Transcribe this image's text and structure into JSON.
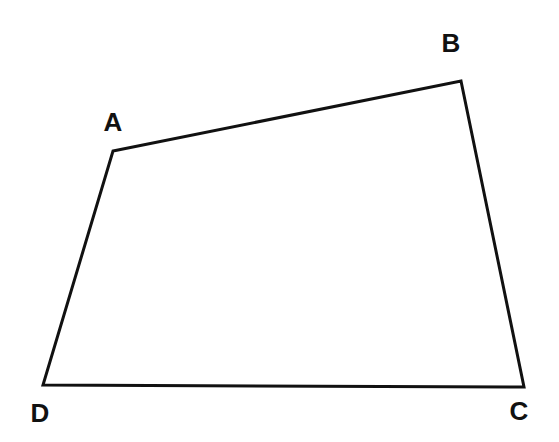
{
  "diagram": {
    "type": "quadrilateral",
    "stroke_color": "#111111",
    "stroke_width": 3,
    "vertices": [
      {
        "id": "A",
        "x": 113,
        "y": 151,
        "label": "A",
        "label_x": 113,
        "label_y": 131
      },
      {
        "id": "B",
        "x": 461,
        "y": 81,
        "label": "B",
        "label_x": 451,
        "label_y": 52
      },
      {
        "id": "C",
        "x": 524,
        "y": 387,
        "label": "C",
        "label_x": 519,
        "label_y": 420
      },
      {
        "id": "D",
        "x": 43,
        "y": 385,
        "label": "D",
        "label_x": 40,
        "label_y": 422
      }
    ],
    "edges": [
      [
        "A",
        "B"
      ],
      [
        "B",
        "C"
      ],
      [
        "C",
        "D"
      ],
      [
        "D",
        "A"
      ]
    ]
  }
}
